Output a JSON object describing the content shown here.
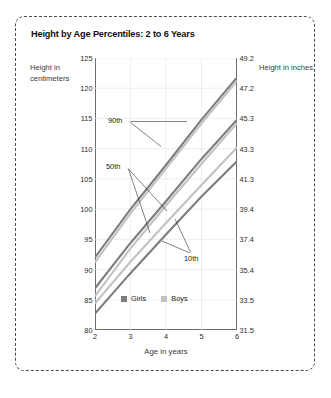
{
  "chart_data": {
    "type": "line",
    "title": "Height by Age Percentiles: 2 to 6 Years",
    "xlabel": "Age in years",
    "ylabel": "Height in centimeters",
    "ylabel_right": "Height in inches",
    "x": [
      2,
      3,
      4,
      5,
      6
    ],
    "xlim": [
      2,
      6
    ],
    "xticks": [
      "2",
      "3",
      "4",
      "5",
      "6"
    ],
    "ylim": [
      80,
      125
    ],
    "yticks": [
      "80",
      "85",
      "90",
      "95",
      "100",
      "105",
      "110",
      "115",
      "120",
      "125"
    ],
    "yticks_right": [
      "31.5",
      "33.5",
      "35.4",
      "37.4",
      "39.4",
      "41.3",
      "43.3",
      "45.3",
      "47.2",
      "49.2"
    ],
    "grid": true,
    "legend_position": "inside-bottom-center",
    "legend": [
      {
        "name": "Girls",
        "color": "#7d7d7d"
      },
      {
        "name": "Boys",
        "color": "#c2c2c2"
      }
    ],
    "annotations": [
      {
        "label": "90th"
      },
      {
        "label": "50th"
      },
      {
        "label": "10th"
      }
    ],
    "series": [
      {
        "name": "Girls 90th",
        "percentile": "90th",
        "group": "Girls",
        "color": "#7d7d7d",
        "values": [
          92.0,
          100.0,
          107.3,
          114.8,
          121.8
        ]
      },
      {
        "name": "Boys 90th",
        "percentile": "90th",
        "group": "Boys",
        "color": "#c2c2c2",
        "values": [
          91.2,
          99.3,
          106.7,
          114.2,
          121.2
        ]
      },
      {
        "name": "Girls 50th",
        "percentile": "50th",
        "group": "Girls",
        "color": "#7d7d7d",
        "values": [
          86.9,
          94.4,
          101.3,
          108.3,
          114.8
        ]
      },
      {
        "name": "Boys 50th",
        "percentile": "50th",
        "group": "Boys",
        "color": "#c2c2c2",
        "values": [
          85.6,
          93.5,
          100.6,
          107.5,
          114.2
        ]
      },
      {
        "name": "Boys 10th",
        "percentile": "10th",
        "group": "Boys",
        "color": "#c2c2c2",
        "values": [
          84.4,
          91.3,
          97.7,
          104.0,
          110.2
        ]
      },
      {
        "name": "Girls 10th",
        "percentile": "10th",
        "group": "Girls",
        "color": "#7d7d7d",
        "values": [
          82.7,
          89.4,
          95.8,
          102.1,
          107.9
        ]
      }
    ]
  }
}
